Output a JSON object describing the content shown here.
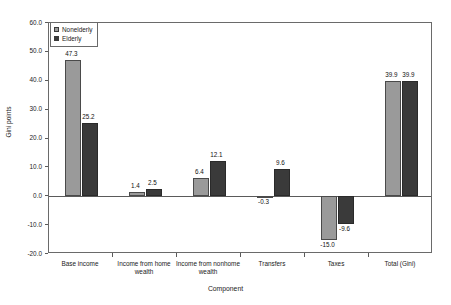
{
  "chart_data": {
    "type": "bar",
    "title": "",
    "xlabel": "Component",
    "ylabel": "Gini points",
    "ylim": [
      -20.0,
      60.0
    ],
    "ytick_step": 10.0,
    "ytick_labels": [
      "60.0",
      "50.0",
      "40.0",
      "30.0",
      "20.0",
      "10.0",
      "0.0",
      "-10.0",
      "-20.0"
    ],
    "ytick_values": [
      60.0,
      50.0,
      40.0,
      30.0,
      20.0,
      10.0,
      0.0,
      -10.0,
      -20.0
    ],
    "grid": false,
    "legend_position": "top-left",
    "categories": [
      "Base income",
      "Income from home wealth",
      "Income from nonhome wealth",
      "Transfers",
      "Taxes",
      "Total (Gini)"
    ],
    "series": [
      {
        "name": "Nonelderly",
        "color": "#9a9a9a",
        "values": [
          47.3,
          1.4,
          6.4,
          -0.3,
          -15.0,
          39.9
        ],
        "labels": [
          "47.3",
          "1.4",
          "6.4",
          "-0.3",
          "-15.0",
          "39.9"
        ]
      },
      {
        "name": "Elderly",
        "color": "#3a3a3a",
        "values": [
          25.2,
          2.5,
          12.1,
          9.6,
          -9.6,
          39.9
        ],
        "labels": [
          "25.2",
          "2.5",
          "12.1",
          "9.6",
          "-9.6",
          "39.9"
        ]
      }
    ]
  }
}
